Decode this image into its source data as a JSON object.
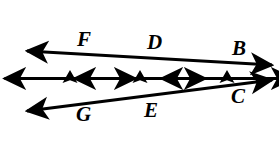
{
  "figure": {
    "kind": "geometry-diagram",
    "width": 279,
    "height": 150,
    "background_color": "#ffffff",
    "stroke_color": "#000000"
  },
  "labels": {
    "F": "F",
    "D": "D",
    "B": "B",
    "G": "G",
    "E": "E",
    "C": "C"
  },
  "geometry": {
    "parallel_lines": [
      {
        "name": "left-vertical-line",
        "x": 70,
        "y_top": 13,
        "y_bottom": 144,
        "tick_y": 79
      },
      {
        "name": "middle-vertical-line",
        "x": 140,
        "y_top": 13,
        "y_bottom": 144,
        "tick_y": 79
      },
      {
        "name": "right-vertical-line",
        "x": 227,
        "y_top": 13,
        "y_bottom": 144,
        "tick_y": 79
      }
    ],
    "transversals": [
      {
        "name": "upper-transversal",
        "x1": 27,
        "y1": 51,
        "x2": 272,
        "y2": 65
      },
      {
        "name": "lower-transversal",
        "x1": 27,
        "y1": 111,
        "x2": 272,
        "y2": 80
      }
    ],
    "intersections": [
      {
        "label": "F",
        "x": 70,
        "y": 54
      },
      {
        "label": "D",
        "x": 140,
        "y": 58
      },
      {
        "label": "B",
        "x": 227,
        "y": 63
      },
      {
        "label": "G",
        "x": 70,
        "y": 106
      },
      {
        "label": "E",
        "x": 140,
        "y": 97
      },
      {
        "label": "C",
        "x": 227,
        "y": 86
      }
    ]
  },
  "label_positions": {
    "F": {
      "x": 77,
      "y": 29
    },
    "D": {
      "x": 147,
      "y": 32
    },
    "B": {
      "x": 232,
      "y": 38
    },
    "G": {
      "x": 76,
      "y": 104
    },
    "E": {
      "x": 144,
      "y": 100
    },
    "C": {
      "x": 231,
      "y": 86
    }
  }
}
